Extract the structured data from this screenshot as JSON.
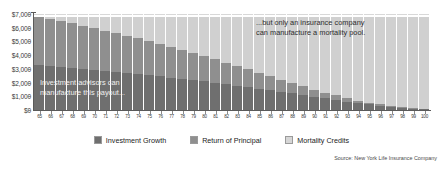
{
  "chart_data": {
    "type": "bar",
    "stacked": true,
    "title": "",
    "subtitle": "",
    "xlabel": "",
    "ylabel": "",
    "ylim": [
      0,
      7000
    ],
    "yticks": [
      0,
      1000,
      2000,
      3000,
      4000,
      5000,
      6000,
      7000
    ],
    "ytick_labels": [
      "$0",
      "$1,000",
      "$2,000",
      "$3,000",
      "$4,000",
      "$5,000",
      "$6,000",
      "$7,000"
    ],
    "grid": true,
    "legend_position": "bottom",
    "categories": [
      65,
      66,
      67,
      68,
      69,
      70,
      71,
      72,
      73,
      74,
      75,
      76,
      77,
      78,
      79,
      80,
      81,
      82,
      83,
      84,
      85,
      86,
      87,
      88,
      89,
      90,
      91,
      92,
      93,
      94,
      95,
      96,
      97,
      98,
      99,
      100
    ],
    "series": [
      {
        "name": "Investment Growth",
        "color": "#6f6f6f",
        "values": [
          3300,
          3230,
          3160,
          3090,
          3010,
          2940,
          2860,
          2780,
          2700,
          2620,
          2530,
          2450,
          2360,
          2270,
          2170,
          2080,
          1980,
          1880,
          1780,
          1670,
          1560,
          1450,
          1340,
          1220,
          1100,
          980,
          860,
          740,
          620,
          510,
          410,
          320,
          240,
          170,
          110,
          60
        ]
      },
      {
        "name": "Return of Principal",
        "color": "#8f8f8f",
        "values": [
          3500,
          3410,
          3320,
          3230,
          3130,
          3030,
          2930,
          2820,
          2710,
          2600,
          2480,
          2360,
          2240,
          2110,
          1980,
          1850,
          1710,
          1570,
          1430,
          1290,
          1150,
          1010,
          880,
          750,
          630,
          510,
          410,
          320,
          240,
          180,
          130,
          90,
          60,
          40,
          25,
          15
        ]
      },
      {
        "name": "Mortality Credits",
        "color": "#d0d0d0",
        "values": [
          0,
          160,
          320,
          480,
          660,
          830,
          1010,
          1200,
          1390,
          1580,
          1790,
          1990,
          2200,
          2420,
          2650,
          2870,
          3110,
          3350,
          3590,
          3840,
          4090,
          4340,
          4580,
          4830,
          5070,
          5310,
          5530,
          5740,
          5940,
          6110,
          6260,
          6390,
          6500,
          6590,
          6665,
          6725
        ]
      }
    ],
    "total": 6800,
    "annotations": [
      {
        "id": "left",
        "text": "Investment advisors can\nmanufacture this payout..."
      },
      {
        "id": "right",
        "text": "...but only an insurance company\ncan manufacture a mortality pool."
      }
    ],
    "source": "Source: New York Life Insurance Company"
  },
  "legend": {
    "items": [
      {
        "label": "Investment Growth",
        "swatch": "#6f6f6f"
      },
      {
        "label": "Return of Principal",
        "swatch": "#8f8f8f"
      },
      {
        "label": "Mortality Credits",
        "swatch": "#d6d6d6"
      }
    ]
  }
}
